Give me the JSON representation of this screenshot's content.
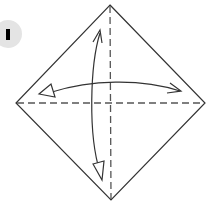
{
  "diagram": {
    "type": "origami-fold-instruction",
    "step": {
      "number": "1",
      "badge_color": "#e4e4e4",
      "mark_color": "#000000"
    },
    "paper": {
      "shape": "square-rotated-45",
      "corners": {
        "top": [
          110,
          5
        ],
        "right": [
          205,
          103
        ],
        "bottom": [
          111,
          200
        ],
        "left": [
          16,
          103
        ]
      },
      "edge_color": "#333333"
    },
    "creases": [
      {
        "name": "vertical-valley-fold",
        "from": [
          110,
          5
        ],
        "to": [
          111,
          200
        ],
        "style": "dashed",
        "color": "#555555"
      },
      {
        "name": "horizontal-valley-fold",
        "from": [
          16,
          103
        ],
        "to": [
          205,
          103
        ],
        "style": "dashed",
        "color": "#555555"
      }
    ],
    "arrows": [
      {
        "name": "vertical-fold-arrow",
        "direction": "fold-and-unfold",
        "start": [
          100,
          32
        ],
        "end": [
          101,
          178
        ]
      },
      {
        "name": "horizontal-fold-arrow",
        "direction": "fold-and-unfold",
        "start": [
          44,
          91
        ],
        "end": [
          180,
          91
        ]
      }
    ]
  }
}
